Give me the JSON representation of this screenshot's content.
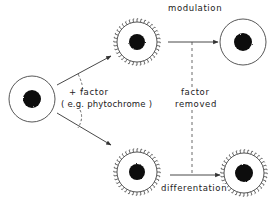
{
  "labels": {
    "modulation": "modulation",
    "factor_plus": "+ factor",
    "factor_example": "( e.g. phytochrome )",
    "factor_removed_1": "factor",
    "factor_removed_2": "removed",
    "differentiation": "differentation"
  },
  "cells": [
    {
      "id": "initial",
      "cx": 32,
      "cy": 99,
      "r": 23,
      "nucleus_r": 9,
      "spiked": false
    },
    {
      "id": "induced-top",
      "cx": 137,
      "cy": 42,
      "r": 20,
      "nucleus_r": 8,
      "spiked": true
    },
    {
      "id": "induced-bottom",
      "cx": 137,
      "cy": 172,
      "r": 20,
      "nucleus_r": 8,
      "spiked": true
    },
    {
      "id": "modulated",
      "cx": 243,
      "cy": 42,
      "r": 23,
      "nucleus_r": 9,
      "spiked": false
    },
    {
      "id": "differentiated",
      "cx": 244,
      "cy": 173,
      "r": 20,
      "nucleus_r": 8,
      "spiked": true
    }
  ],
  "colors": {
    "line": "#333333",
    "nucleus": "#111111"
  }
}
